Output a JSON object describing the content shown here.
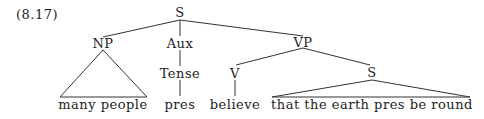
{
  "example_number": "(8.17)",
  "tree": {
    "root": "S",
    "np": "NP",
    "aux": "Aux",
    "vp": "VP",
    "tense": "Tense",
    "v": "V",
    "s_embedded": "S",
    "leaves": {
      "np_leaf": "many people",
      "tense_leaf": "pres",
      "v_leaf": "believe",
      "s_leaf": "that the earth pres be round"
    }
  }
}
